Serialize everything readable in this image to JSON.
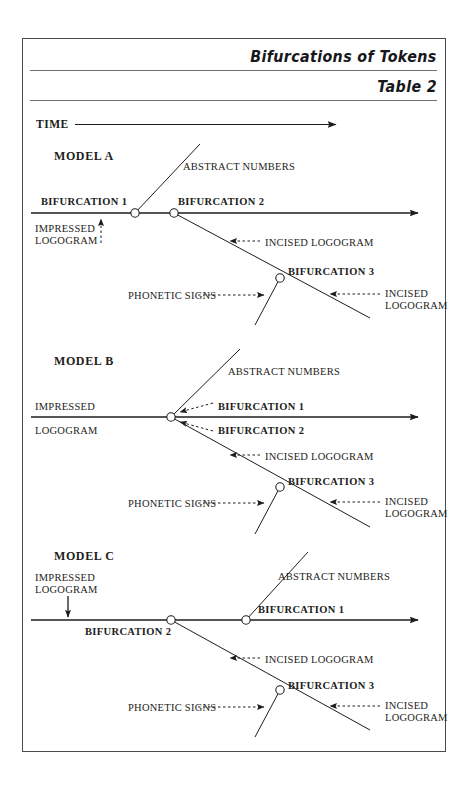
{
  "header": {
    "title": "Bifurcations of Tokens",
    "subtitle": "Table 2"
  },
  "axis": {
    "time_label": "TIME"
  },
  "models": [
    {
      "name": "MODEL A",
      "labels": {
        "abstract_numbers": "ABSTRACT NUMBERS",
        "bifurcation_1": "BIFURCATION 1",
        "bifurcation_2": "BIFURCATION 2",
        "bifurcation_3": "BIFURCATION 3",
        "impressed_logogram_line1": "IMPRESSED",
        "impressed_logogram_line2": "LOGOGRAM",
        "incised_logogram_upper": "INCISED LOGOGRAM",
        "phonetic_signs": "PHONETIC SIGNS",
        "incised_logogram_lower_line1": "INCISED",
        "incised_logogram_lower_line2": "LOGOGRAM"
      }
    },
    {
      "name": "MODEL B",
      "labels": {
        "abstract_numbers": "ABSTRACT NUMBERS",
        "bifurcation_1": "BIFURCATION 1",
        "bifurcation_2": "BIFURCATION 2",
        "bifurcation_3": "BIFURCATION 3",
        "impressed_logogram_line1": "IMPRESSED",
        "impressed_logogram_line2": "LOGOGRAM",
        "incised_logogram_upper": "INCISED LOGOGRAM",
        "phonetic_signs": "PHONETIC SIGNS",
        "incised_logogram_lower_line1": "INCISED",
        "incised_logogram_lower_line2": "LOGOGRAM"
      }
    },
    {
      "name": "MODEL C",
      "labels": {
        "abstract_numbers": "ABSTRACT NUMBERS",
        "bifurcation_1": "BIFURCATION 1",
        "bifurcation_2": "BIFURCATION 2",
        "bifurcation_3": "BIFURCATION 3",
        "impressed_logogram_line1": "IMPRESSED",
        "impressed_logogram_line2": "LOGOGRAM",
        "incised_logogram_upper": "INCISED LOGOGRAM",
        "phonetic_signs": "PHONETIC SIGNS",
        "incised_logogram_lower_line1": "INCISED",
        "incised_logogram_lower_line2": "LOGOGRAM"
      }
    }
  ],
  "colors": {
    "ink": "#1d1d20",
    "frame": "#4a4a52",
    "rule": "#6b6b73",
    "page": "#ffffff"
  }
}
